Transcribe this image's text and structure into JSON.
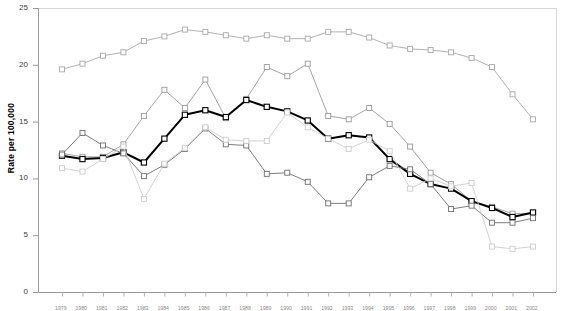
{
  "chart_data": {
    "type": "line",
    "title": "",
    "xlabel": "",
    "ylabel": "Rate per 100,000",
    "ylim": [
      0,
      25
    ],
    "yticks": [
      0,
      5,
      10,
      15,
      20,
      25
    ],
    "grid": false,
    "legend": "none",
    "marker": "square-open",
    "x": [
      "1979",
      "1980",
      "1981",
      "1982",
      "1983",
      "1984",
      "1985",
      "1986",
      "1987",
      "1988",
      "1989",
      "1990",
      "1991",
      "1992",
      "1993",
      "1994",
      "1995",
      "1996",
      "1997",
      "1998",
      "1999",
      "2000",
      "2001",
      "2002"
    ],
    "categories": [
      "1979",
      "1980",
      "1981",
      "1982",
      "1983",
      "1984",
      "1985",
      "1986",
      "1987",
      "1988",
      "1989",
      "1990",
      "1991",
      "1992",
      "1993",
      "1994",
      "1995",
      "1996",
      "1997",
      "1998",
      "1999",
      "2000",
      "2001",
      "2002"
    ],
    "series": [
      {
        "name": "Series 1",
        "color": "#a8a8a8",
        "width": 0.9,
        "values": [
          19.6,
          20.1,
          20.8,
          21.1,
          22.1,
          22.5,
          23.1,
          22.9,
          22.6,
          22.3,
          22.6,
          22.3,
          22.3,
          22.9,
          22.9,
          22.4,
          21.7,
          21.4,
          21.3,
          21.1,
          20.6,
          19.8,
          17.4,
          15.2
        ]
      },
      {
        "name": "Series 2",
        "color": "#9a9a9a",
        "width": 0.9,
        "values": [
          12.2,
          11.9,
          11.9,
          13.0,
          15.5,
          17.8,
          16.2,
          18.7,
          15.3,
          17.0,
          19.8,
          19.0,
          20.1,
          15.5,
          15.2,
          16.2,
          14.8,
          12.8,
          10.5,
          9.5,
          8.0,
          7.5,
          6.9,
          6.9
        ]
      },
      {
        "name": "Series 3 (bold)",
        "color": "#000000",
        "width": 2.0,
        "values": [
          12.0,
          11.7,
          11.8,
          12.3,
          11.4,
          13.5,
          15.6,
          16.0,
          15.4,
          16.9,
          16.3,
          15.9,
          15.1,
          13.5,
          13.8,
          13.6,
          11.7,
          10.4,
          9.5,
          9.1,
          8.0,
          7.4,
          6.6,
          7.0
        ]
      },
      {
        "name": "Series 4",
        "color": "#6e6e6e",
        "width": 0.9,
        "values": [
          12.1,
          14.0,
          12.9,
          12.2,
          10.2,
          11.2,
          12.6,
          14.4,
          13.0,
          12.9,
          10.4,
          10.5,
          9.7,
          7.8,
          7.8,
          10.1,
          11.1,
          10.8,
          9.5,
          7.3,
          7.6,
          6.1,
          6.1,
          6.5
        ]
      },
      {
        "name": "Series 5",
        "color": "#cdcdcd",
        "width": 0.9,
        "values": [
          10.9,
          10.6,
          11.7,
          12.8,
          8.2,
          11.3,
          12.7,
          14.5,
          13.4,
          13.3,
          13.3,
          15.8,
          14.5,
          13.5,
          12.6,
          13.4,
          12.4,
          9.1,
          10.0,
          9.3,
          9.6,
          4.0,
          3.8,
          4.0
        ]
      }
    ]
  },
  "axis": {
    "y_title": "Rate per 100,000",
    "y_tick_labels": [
      "0",
      "5",
      "10",
      "15",
      "20",
      "25"
    ]
  }
}
